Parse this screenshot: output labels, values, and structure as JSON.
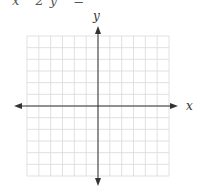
{
  "top_text_fragment": "x   2y   =",
  "graph": {
    "x_axis_label": "x",
    "y_axis_label": "y",
    "grid": {
      "columns": 12,
      "rows": 12,
      "color": "#d9d9d9"
    },
    "axis_color": "#333333",
    "plotted_content": "none (blank coordinate grid)"
  }
}
